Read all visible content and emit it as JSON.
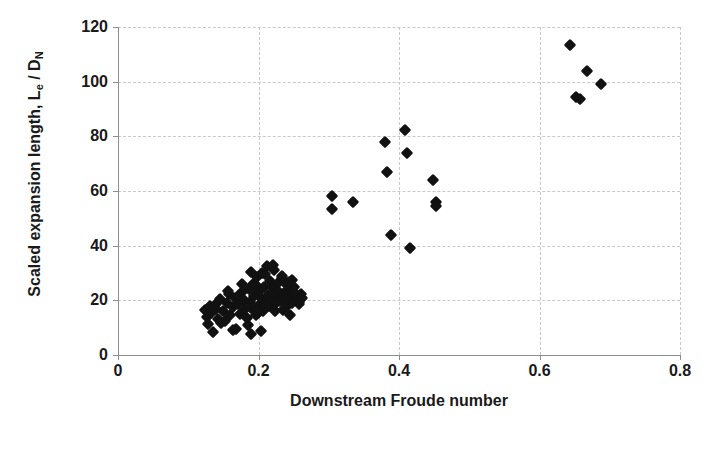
{
  "chart_data": {
    "type": "scatter",
    "title": "",
    "xlabel": "Downstream Froude number",
    "ylabel": "Scaled expansion length, Le / DN",
    "ylabel_parts": {
      "prefix": "Scaled expansion length, L",
      "sub1": "e",
      "mid": " / D",
      "sub2": "N"
    },
    "xlim": [
      0,
      0.8
    ],
    "ylim": [
      0,
      120
    ],
    "xticks": [
      0,
      0.2,
      0.4,
      0.6,
      0.8
    ],
    "xtick_labels": [
      "0",
      "0.2",
      "0.4",
      "0.6",
      "0.8"
    ],
    "yticks": [
      0,
      20,
      40,
      60,
      80,
      100,
      120
    ],
    "ytick_labels": [
      "0",
      "20",
      "40",
      "60",
      "80",
      "100",
      "120"
    ],
    "grid": "dashed horizontal and vertical gridlines, light gray",
    "legend": "none",
    "marker": "filled black diamond",
    "marker_color": "#111111",
    "grid_color": "#c9c9c9",
    "axis_color": "#8d8d8d",
    "background": "#ffffff",
    "series": [
      {
        "name": "Scaled expansion length vs downstream Froude number",
        "points": [
          [
            0.124,
            16.5
          ],
          [
            0.126,
            14.0
          ],
          [
            0.128,
            11.5
          ],
          [
            0.131,
            18.0
          ],
          [
            0.133,
            15.5
          ],
          [
            0.135,
            8.5
          ],
          [
            0.14,
            17.0
          ],
          [
            0.142,
            13.0
          ],
          [
            0.145,
            20.5
          ],
          [
            0.15,
            16.0
          ],
          [
            0.152,
            12.5
          ],
          [
            0.155,
            19.0
          ],
          [
            0.158,
            22.5
          ],
          [
            0.16,
            14.5
          ],
          [
            0.163,
            17.5
          ],
          [
            0.166,
            21.0
          ],
          [
            0.168,
            9.5
          ],
          [
            0.171,
            18.5
          ],
          [
            0.174,
            15.0
          ],
          [
            0.176,
            23.0
          ],
          [
            0.179,
            20.0
          ],
          [
            0.181,
            16.8
          ],
          [
            0.183,
            13.5
          ],
          [
            0.186,
            24.0
          ],
          [
            0.188,
            19.5
          ],
          [
            0.19,
            17.2
          ],
          [
            0.192,
            26.0
          ],
          [
            0.194,
            21.5
          ],
          [
            0.196,
            14.8
          ],
          [
            0.198,
            28.5
          ],
          [
            0.2,
            18.2
          ],
          [
            0.201,
            23.5
          ],
          [
            0.203,
            20.8
          ],
          [
            0.205,
            30.0
          ],
          [
            0.206,
            16.2
          ],
          [
            0.208,
            25.0
          ],
          [
            0.21,
            19.0
          ],
          [
            0.212,
            32.5
          ],
          [
            0.213,
            22.0
          ],
          [
            0.215,
            17.8
          ],
          [
            0.217,
            27.0
          ],
          [
            0.218,
            20.2
          ],
          [
            0.22,
            24.5
          ],
          [
            0.222,
            31.0
          ],
          [
            0.224,
            18.8
          ],
          [
            0.226,
            21.8
          ],
          [
            0.228,
            26.5
          ],
          [
            0.229,
            23.2
          ],
          [
            0.231,
            19.8
          ],
          [
            0.233,
            28.0
          ],
          [
            0.235,
            16.5
          ],
          [
            0.236,
            22.8
          ],
          [
            0.238,
            20.5
          ],
          [
            0.24,
            25.5
          ],
          [
            0.241,
            18.0
          ],
          [
            0.243,
            23.8
          ],
          [
            0.245,
            21.2
          ],
          [
            0.247,
            27.5
          ],
          [
            0.248,
            19.2
          ],
          [
            0.25,
            24.8
          ],
          [
            0.252,
            22.2
          ],
          [
            0.254,
            20.0
          ],
          [
            0.19,
            7.8
          ],
          [
            0.164,
            9.0
          ],
          [
            0.204,
            8.8
          ],
          [
            0.245,
            14.5
          ],
          [
            0.255,
            21.5
          ],
          [
            0.258,
            19.5
          ],
          [
            0.26,
            22.5
          ],
          [
            0.262,
            20.8
          ],
          [
            0.185,
            11.0
          ],
          [
            0.172,
            22.0
          ],
          [
            0.196,
            25.5
          ],
          [
            0.209,
            29.5
          ],
          [
            0.221,
            33.0
          ],
          [
            0.139,
            18.5
          ],
          [
            0.147,
            11.8
          ],
          [
            0.156,
            23.5
          ],
          [
            0.177,
            26.0
          ],
          [
            0.189,
            30.5
          ],
          [
            0.199,
            15.5
          ],
          [
            0.211,
            17.5
          ],
          [
            0.223,
            16.0
          ],
          [
            0.234,
            29.0
          ],
          [
            0.244,
            26.8
          ],
          [
            0.251,
            23.0
          ],
          [
            0.257,
            18.5
          ],
          [
            0.305,
            58.0
          ],
          [
            0.305,
            53.5
          ],
          [
            0.335,
            56.0
          ],
          [
            0.38,
            78.0
          ],
          [
            0.383,
            67.0
          ],
          [
            0.388,
            44.0
          ],
          [
            0.408,
            82.5
          ],
          [
            0.412,
            74.0
          ],
          [
            0.415,
            39.0
          ],
          [
            0.448,
            64.0
          ],
          [
            0.452,
            56.0
          ],
          [
            0.452,
            54.5
          ],
          [
            0.643,
            113.5
          ],
          [
            0.652,
            94.5
          ],
          [
            0.657,
            93.5
          ],
          [
            0.668,
            104.0
          ],
          [
            0.688,
            99.0
          ]
        ]
      }
    ]
  },
  "figure": {
    "caption": ""
  }
}
